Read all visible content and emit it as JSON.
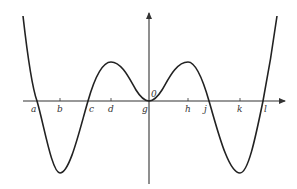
{
  "figure": {
    "type": "function-graph",
    "origin_label": "0",
    "x_labels": [
      {
        "id": "a",
        "text": "a",
        "x": 36
      },
      {
        "id": "b",
        "text": "b",
        "x": 60
      },
      {
        "id": "c",
        "text": "c",
        "x": 88
      },
      {
        "id": "d",
        "text": "d",
        "x": 111
      },
      {
        "id": "g",
        "text": "g",
        "x": 148
      },
      {
        "id": "h",
        "text": "h",
        "x": 188
      },
      {
        "id": "j",
        "text": "j",
        "x": 209
      },
      {
        "id": "k",
        "text": "k",
        "x": 240
      },
      {
        "id": "l",
        "text": "l",
        "x": 263
      }
    ],
    "colors": {
      "curve": "#222222",
      "axis": "#333333",
      "background": "#ffffff"
    }
  }
}
